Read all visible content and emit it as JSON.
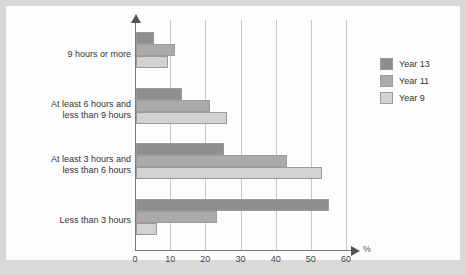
{
  "chart_data": {
    "type": "bar",
    "orientation": "horizontal",
    "title": "",
    "xlabel": "%",
    "ylabel": "",
    "xlim": [
      0,
      60
    ],
    "xticks": [
      0,
      10,
      20,
      30,
      40,
      50,
      60
    ],
    "xtick_labels": [
      "0",
      "10",
      "20",
      "30",
      "40",
      "50",
      "60"
    ],
    "grid": true,
    "legend_position": "right",
    "categories": [
      "9 hours or more",
      "At least 6 hours and\nless than 9 hours",
      "At least 3 hours and\nless than 6 hours",
      "Less than 3 hours"
    ],
    "series": [
      {
        "name": "Year 13",
        "color": "#8e8e8e",
        "values": [
          5,
          13,
          25,
          55
        ]
      },
      {
        "name": "Year 11",
        "color": "#ababab",
        "values": [
          11,
          21,
          43,
          23
        ]
      },
      {
        "name": "Year 9",
        "color": "#d2d2d2",
        "values": [
          9,
          26,
          53,
          6
        ]
      }
    ]
  },
  "legend": {
    "entries": [
      {
        "label": "Year 13"
      },
      {
        "label": "Year 11"
      },
      {
        "label": "Year 9"
      }
    ]
  },
  "axis": {
    "x_unit_label": "%"
  }
}
